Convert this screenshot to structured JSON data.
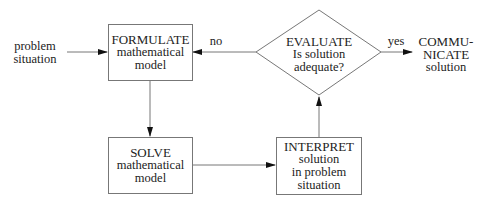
{
  "diagram": {
    "type": "flowchart",
    "nodes": {
      "input": {
        "line1": "problem",
        "line2": "situation"
      },
      "formulate": {
        "line1": "FORMULATE",
        "line2": "mathematical",
        "line3": "model"
      },
      "solve": {
        "line1": "SOLVE",
        "line2": "mathematical",
        "line3": "model"
      },
      "interpret": {
        "line1": "INTERPRET",
        "line2": "solution",
        "line3": "in problem",
        "line4": "situation"
      },
      "evaluate": {
        "line1": "EVALUATE",
        "line2": "Is solution",
        "line3": "adequate?"
      },
      "communicate": {
        "line1": "COMMU-",
        "line2": "NICATE",
        "line3": "solution"
      }
    },
    "edges": {
      "no": "no",
      "yes": "yes"
    },
    "colors": {
      "line": "#777777",
      "text": "#222222",
      "arrow": "#111111"
    }
  }
}
